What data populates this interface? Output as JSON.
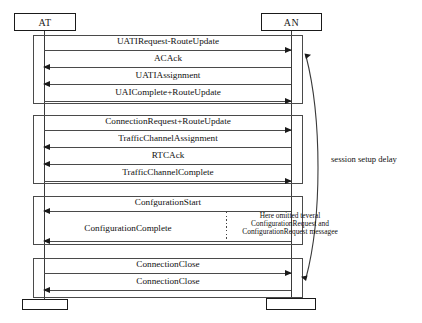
{
  "diagram": {
    "participants": [
      {
        "id": "at",
        "label": "AT",
        "x": 14,
        "width": 62
      },
      {
        "id": "an",
        "label": "AN",
        "x": 261,
        "width": 61
      }
    ],
    "blocks": [
      {
        "name": "uati-assignment-block",
        "messages": [
          {
            "label": "UATIRequest-RouteUpdate",
            "direction": "right"
          },
          {
            "label": "ACAck",
            "direction": "left"
          },
          {
            "label": "UATIAssignment",
            "direction": "left"
          },
          {
            "label": "UAIComplete+RouteUpdate",
            "direction": "right"
          }
        ]
      },
      {
        "name": "traffic-channel-block",
        "messages": [
          {
            "label": "ConnectionRequest+RouteUpdate",
            "direction": "right"
          },
          {
            "label": "TrafficChannelAssignment",
            "direction": "left"
          },
          {
            "label": "RTCAck",
            "direction": "left"
          },
          {
            "label": "TrafficChannelComplete",
            "direction": "right"
          }
        ]
      },
      {
        "name": "configuration-block",
        "messages": [
          {
            "label": "ConfgurationStart",
            "direction": "left"
          },
          {
            "label": "ConfigurationComplete",
            "direction": "left"
          }
        ]
      },
      {
        "name": "connection-close-block",
        "messages": [
          {
            "label": "ConnectionClose",
            "direction": "right"
          },
          {
            "label": "ConnectionClose",
            "direction": "left"
          }
        ]
      }
    ],
    "annotations": {
      "session_delay_label": "session setup delay",
      "omitted_note_line1": "Here omitted teveral",
      "omitted_note_line2": "ConfigurationRequest and",
      "omitted_note_line3": "ConfigurationRequest messagee"
    },
    "colors": {
      "stroke": "#1a1a1a",
      "line": "#4a4a4a",
      "background": "#ffffff"
    }
  }
}
